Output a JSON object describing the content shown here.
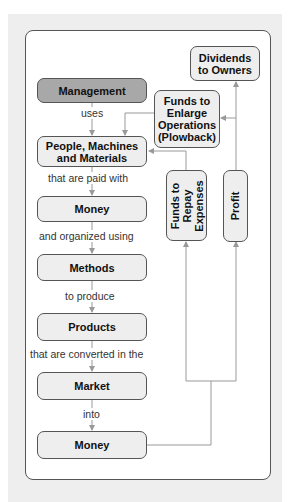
{
  "diagram": {
    "title": "",
    "colors": {
      "background": "#eeeeee",
      "panel": "#ffffff",
      "box_fill": "#eeeeee",
      "box_fill_highlight": "#a8a8a8",
      "box_border": "#555555",
      "connector": "#999999"
    },
    "main_flow": {
      "nodes": [
        {
          "id": "management",
          "label": "Management"
        },
        {
          "id": "people",
          "label": "People, Machines and Materials"
        },
        {
          "id": "money1",
          "label": "Money"
        },
        {
          "id": "methods",
          "label": "Methods"
        },
        {
          "id": "products",
          "label": "Products"
        },
        {
          "id": "market",
          "label": "Market"
        },
        {
          "id": "money2",
          "label": "Money"
        }
      ],
      "edge_labels": [
        "uses",
        "that are paid with",
        "and organized using",
        "to produce",
        "that are converted in the",
        "into"
      ]
    },
    "side_nodes": {
      "dividends": {
        "line1": "Dividends",
        "line2": "to Owners"
      },
      "plowback": {
        "line1": "Funds to",
        "line2": "Enlarge",
        "line3": "Operations",
        "line4": "(Plowback)"
      },
      "repay": {
        "line1": "Funds to",
        "line2": "Repay",
        "line3": "Expenses"
      },
      "profit": {
        "label": "Profit"
      }
    },
    "edges": [
      {
        "from": "management",
        "to": "people",
        "label": "uses"
      },
      {
        "from": "people",
        "to": "money1",
        "label": "that are paid with"
      },
      {
        "from": "money1",
        "to": "methods",
        "label": "and organized using"
      },
      {
        "from": "methods",
        "to": "products",
        "label": "to produce"
      },
      {
        "from": "products",
        "to": "market",
        "label": "that are converted in the"
      },
      {
        "from": "market",
        "to": "money2",
        "label": "into"
      },
      {
        "from": "money2",
        "to": "repay"
      },
      {
        "from": "money2",
        "to": "profit"
      },
      {
        "from": "repay",
        "to": "people"
      },
      {
        "from": "profit",
        "to": "plowback"
      },
      {
        "from": "profit",
        "to": "dividends"
      },
      {
        "from": "plowback",
        "to": "people"
      }
    ]
  }
}
